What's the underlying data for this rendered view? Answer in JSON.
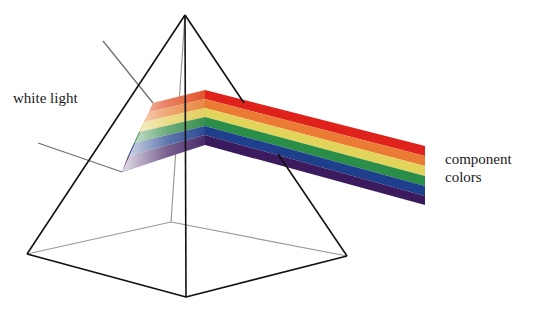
{
  "diagram": {
    "labels": {
      "input": "white light",
      "output_line1": "component",
      "output_line2": "colors"
    },
    "bands": [
      {
        "name": "red",
        "color": "#e0221c"
      },
      {
        "name": "orange",
        "color": "#ea7a34"
      },
      {
        "name": "yellow",
        "color": "#e2d35a"
      },
      {
        "name": "green",
        "color": "#2a8e48"
      },
      {
        "name": "blue",
        "color": "#1e3f8c"
      },
      {
        "name": "violet",
        "color": "#3b1a5e"
      }
    ],
    "colors": {
      "front_edge": "#111111",
      "hidden_edge": "#9a9a9a",
      "pointer": "#707070"
    }
  }
}
